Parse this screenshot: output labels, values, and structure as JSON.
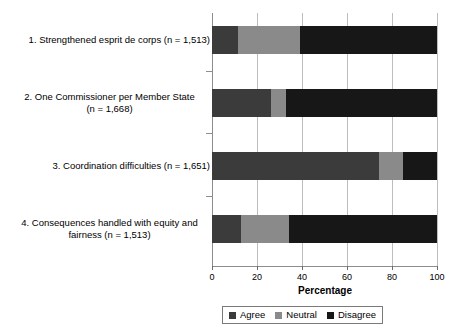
{
  "chart_data": {
    "type": "bar",
    "orientation": "horizontal",
    "stacked": true,
    "title": "",
    "xlabel": "Percentage",
    "ylabel": "",
    "xlim": [
      0,
      100
    ],
    "xticks": [
      0,
      20,
      40,
      60,
      80,
      100
    ],
    "grid": true,
    "legend_position": "bottom",
    "categories": [
      "1. Strengthened esprit de corps (n = 1,513)",
      "2. One Commissioner per Member State (n = 1,668)",
      "3. Coordination difficulties (n = 1,651)",
      "4. Consequences handled with equity and fairness  (n = 1,513)"
    ],
    "category_lines": [
      [
        "1. Strengthened esprit de corps (n = 1,513)"
      ],
      [
        "2. One Commissioner per Member State",
        "(n = 1,668)"
      ],
      [
        "3. Coordination difficulties (n = 1,651)"
      ],
      [
        "4. Consequences handled with equity and",
        "fairness  (n = 1,513)"
      ]
    ],
    "series": [
      {
        "name": "Agree",
        "color": "#3b3b3b",
        "values": [
          11.5,
          26.0,
          74.0,
          13.0
        ]
      },
      {
        "name": "Neutral",
        "color": "#8a8a8a",
        "values": [
          27.5,
          7.0,
          11.0,
          21.0
        ]
      },
      {
        "name": "Disagree",
        "color": "#171717",
        "values": [
          61.0,
          67.0,
          15.0,
          66.0
        ]
      }
    ]
  },
  "axis": {
    "x_title": "Percentage",
    "x_tick_labels": [
      "0",
      "20",
      "40",
      "60",
      "80",
      "100"
    ]
  },
  "legend": {
    "items": [
      {
        "label": "Agree",
        "swatch": "agree-swatch"
      },
      {
        "label": "Neutral",
        "swatch": "neutral-swatch"
      },
      {
        "label": "Disagree",
        "swatch": "disagree-swatch"
      }
    ]
  },
  "colors": {
    "agree": "#3b3b3b",
    "neutral": "#8a8a8a",
    "disagree": "#171717",
    "grid": "#bdbdbd",
    "axis": "#8d8d8d"
  }
}
